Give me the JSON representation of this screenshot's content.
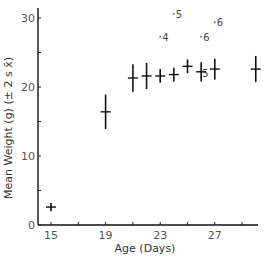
{
  "chart_data": {
    "type": "scatter",
    "title": "",
    "xlabel": "Age (Days)",
    "ylabel": "Mean Weight (g) (± 2 s x̄)",
    "xlim": [
      14.3,
      30.3
    ],
    "ylim": [
      0,
      31
    ],
    "x_ticks": [
      15,
      17,
      19,
      21,
      23,
      25,
      27,
      29
    ],
    "x_tick_labels": [
      "15",
      "",
      "19",
      "",
      "23",
      "",
      "27",
      ""
    ],
    "y_ticks": [
      0,
      5,
      10,
      15,
      20,
      25,
      30
    ],
    "y_tick_labels": [
      "0",
      "",
      "10",
      "",
      "20",
      "",
      "30"
    ],
    "grid": false,
    "series": [
      {
        "name": "Mean weight",
        "points": [
          {
            "x": 15,
            "y": 2.6,
            "err": 0.6
          },
          {
            "x": 19,
            "y": 16.4,
            "err": 2.5
          },
          {
            "x": 21,
            "y": 21.3,
            "err": 2.0
          },
          {
            "x": 22,
            "y": 21.6,
            "err": 1.9
          },
          {
            "x": 23,
            "y": 21.6,
            "err": 1.0
          },
          {
            "x": 24,
            "y": 21.8,
            "err": 1.0
          },
          {
            "x": 25,
            "y": 23.0,
            "err": 1.0
          },
          {
            "x": 26,
            "y": 22.2,
            "err": 1.4
          },
          {
            "x": 27,
            "y": 22.6,
            "err": 1.5
          },
          {
            "x": 30,
            "y": 22.6,
            "err": 1.9
          }
        ]
      }
    ],
    "annotations": [
      {
        "x": 23,
        "y": 27.3,
        "text": "4"
      },
      {
        "x": 24,
        "y": 30.6,
        "text": "5"
      },
      {
        "x": 26,
        "y": 27.3,
        "text": "6"
      },
      {
        "x": 27,
        "y": 29.4,
        "text": "6"
      },
      {
        "x": 26,
        "y": 22.2,
        "text": "5",
        "inline": true
      }
    ]
  }
}
